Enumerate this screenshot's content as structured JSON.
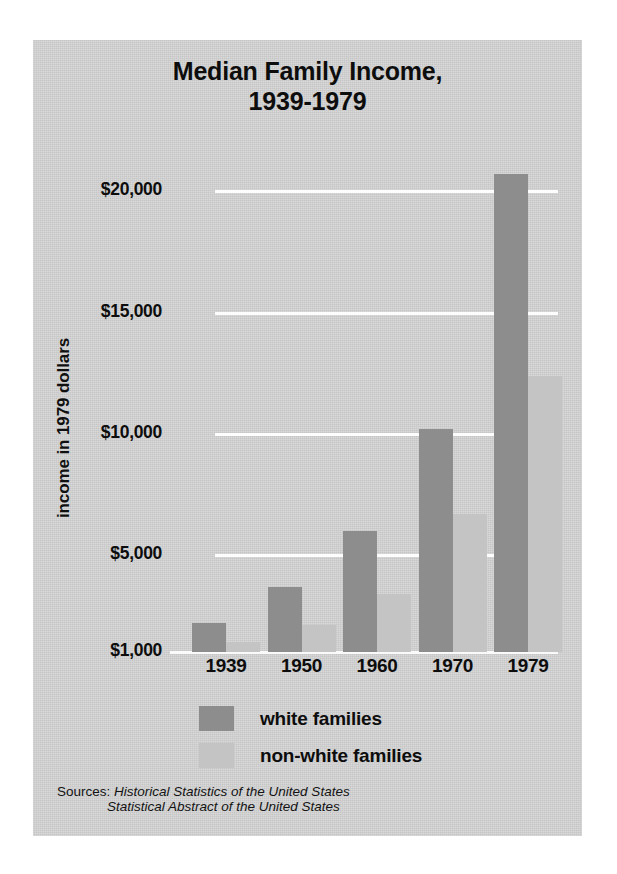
{
  "chart_data": {
    "type": "bar",
    "title": "Median Family Income, 1939-1979",
    "title_line1": "Median Family Income,",
    "title_line2": "1939-1979",
    "xlabel": "",
    "ylabel": "income in 1979 dollars",
    "categories": [
      "1939",
      "1950",
      "1960",
      "1970",
      "1979"
    ],
    "ytick_labels": [
      "$20,000",
      "$15,000",
      "$10,000",
      "$5,000",
      "$1,000"
    ],
    "ytick_values": [
      20000,
      15000,
      10000,
      5000,
      1000
    ],
    "ylim": [
      1000,
      21500
    ],
    "grid": true,
    "legend_position": "bottom",
    "series": [
      {
        "name": "white families",
        "color": "#8d8d8d",
        "values": [
          2200,
          3700,
          6000,
          10200,
          20700
        ]
      },
      {
        "name": "non-white families",
        "color": "#c4c4c4",
        "values": [
          1400,
          2100,
          3400,
          6700,
          12400
        ]
      }
    ],
    "sources_label": "Sources:",
    "sources": [
      "Historical Statistics of the United States",
      "Statistical Abstract of the United States"
    ],
    "background_color": "#d4d4d4",
    "gridline_color": "#fdfdfd",
    "text_color": "#0d0d0d"
  }
}
